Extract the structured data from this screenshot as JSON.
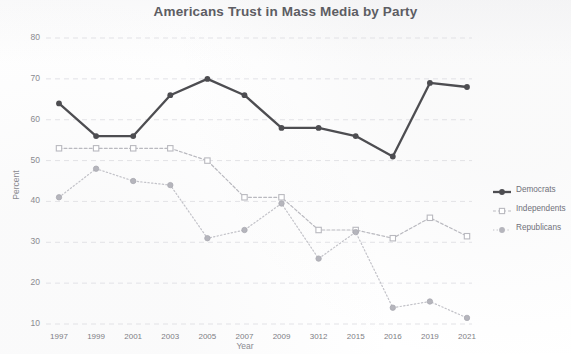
{
  "chart_data": {
    "type": "line",
    "title": "Americans Trust in Mass Media by Party",
    "xlabel": "Year",
    "ylabel": "Percent",
    "categories": [
      "1997",
      "1999",
      "2001",
      "2003",
      "2005",
      "2007",
      "2009",
      "3012",
      "2015",
      "2016",
      "2019",
      "2021"
    ],
    "ylim": [
      10,
      80
    ],
    "yticks": [
      10,
      20,
      30,
      40,
      50,
      60,
      70,
      80
    ],
    "grid": true,
    "legend_position": "right",
    "series": [
      {
        "name": "Democrats",
        "color": "#4d4d51",
        "style": "solid",
        "marker": "circle",
        "values": [
          64,
          56,
          56,
          66,
          70,
          66,
          58,
          58,
          56,
          51,
          69,
          68
        ]
      },
      {
        "name": "Independents",
        "color": "#b9b9bf",
        "style": "dashed",
        "marker": "square",
        "values": [
          53,
          53,
          53,
          53,
          50,
          41,
          41,
          33,
          33,
          31,
          36,
          31.5
        ]
      },
      {
        "name": "Republicans",
        "color": "#c2c2c8",
        "style": "dotted",
        "marker": "circle",
        "values": [
          41,
          48,
          45,
          44,
          31,
          33,
          39.5,
          26,
          32.5,
          14,
          15.5,
          11.5
        ]
      }
    ]
  },
  "legend": {
    "items": [
      {
        "label": "Democrats"
      },
      {
        "label": "Independents"
      },
      {
        "label": "Republicans"
      }
    ]
  }
}
